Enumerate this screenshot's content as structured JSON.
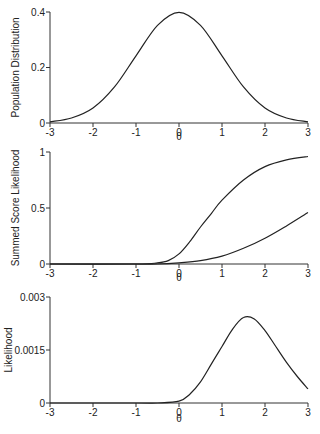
{
  "chart_data": [
    {
      "type": "line",
      "title": "",
      "xlabel": "θ",
      "ylabel": "Population Distribution",
      "xlim": [
        -3,
        3
      ],
      "ylim": [
        0,
        0.4
      ],
      "x_ticks": [
        "-3",
        "-2",
        "-1",
        "0",
        "1",
        "2",
        "3"
      ],
      "y_ticks": [
        "0",
        "0.2",
        "0.4"
      ],
      "grid": false,
      "series": [
        {
          "name": "population",
          "x": [
            -3,
            -2.5,
            -2,
            -1.5,
            -1,
            -0.5,
            0,
            0.5,
            1,
            1.5,
            2,
            2.5,
            3
          ],
          "values": [
            0.004,
            0.018,
            0.054,
            0.13,
            0.242,
            0.352,
            0.399,
            0.352,
            0.242,
            0.13,
            0.054,
            0.018,
            0.004
          ]
        }
      ]
    },
    {
      "type": "line",
      "title": "",
      "xlabel": "θ",
      "ylabel": "Summed Score Likelihood",
      "xlim": [
        -3,
        3
      ],
      "ylim": [
        0,
        1
      ],
      "x_ticks": [
        "-3",
        "-2",
        "-1",
        "0",
        "1",
        "2",
        "3"
      ],
      "y_ticks": [
        "0",
        "0.5",
        "1"
      ],
      "grid": false,
      "series": [
        {
          "name": "upper",
          "x": [
            -3,
            -1,
            -0.5,
            -0.25,
            0,
            0.25,
            0.5,
            0.75,
            1,
            1.5,
            2,
            2.5,
            3
          ],
          "values": [
            0,
            0,
            0.01,
            0.03,
            0.09,
            0.2,
            0.33,
            0.45,
            0.57,
            0.75,
            0.87,
            0.93,
            0.96
          ]
        },
        {
          "name": "lower",
          "x": [
            -3,
            -1,
            -0.5,
            0,
            0.5,
            1,
            1.5,
            2,
            2.5,
            3
          ],
          "values": [
            0,
            0,
            0,
            0.01,
            0.03,
            0.07,
            0.14,
            0.23,
            0.34,
            0.46
          ]
        }
      ]
    },
    {
      "type": "line",
      "title": "",
      "xlabel": "θ",
      "ylabel": "Likelihood",
      "xlim": [
        -3,
        3
      ],
      "ylim": [
        0,
        0.003
      ],
      "x_ticks": [
        "-3",
        "-2",
        "-1",
        "0",
        "1",
        "2",
        "3"
      ],
      "y_ticks": [
        "0",
        "0.0015",
        "0.003"
      ],
      "grid": false,
      "series": [
        {
          "name": "likelihood",
          "x": [
            -3,
            -1,
            -0.5,
            0,
            0.25,
            0.5,
            0.75,
            1,
            1.25,
            1.5,
            1.75,
            2,
            2.25,
            2.5,
            2.75,
            3
          ],
          "values": [
            0,
            0,
            0,
            5e-05,
            0.00025,
            0.0006,
            0.0011,
            0.0016,
            0.0021,
            0.00242,
            0.00238,
            0.00205,
            0.0016,
            0.00115,
            0.00075,
            0.0004
          ]
        }
      ]
    }
  ]
}
